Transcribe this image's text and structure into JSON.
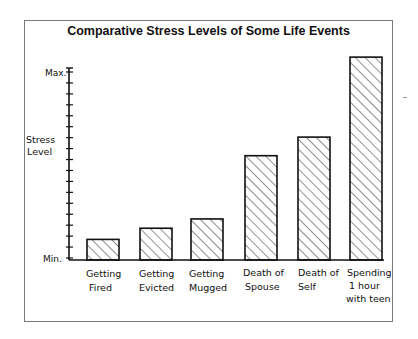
{
  "chart_data": {
    "type": "bar",
    "title": "Comparative Stress Levels of Some Life Events",
    "xlabel": "",
    "ylabel": "Stress Level",
    "y_tick_labels": [
      "Min.",
      "Max."
    ],
    "ylim": [
      0,
      100
    ],
    "grid": false,
    "legend": null,
    "fill_pattern": "diagonal hatch",
    "categories": [
      "Getting Fired",
      "Getting Evicted",
      "Getting Mugged",
      "Death of Spouse",
      "Death of Self",
      "Spending 1 hour with teen"
    ],
    "category_label_lines": [
      [
        "Getting",
        "Fired"
      ],
      [
        "Getting",
        "Evicted"
      ],
      [
        "Getting",
        "Mugged"
      ],
      [
        "Death of",
        "Spouse"
      ],
      [
        "Death of",
        "Self"
      ],
      [
        "Spending",
        "1 hour",
        "with teen"
      ]
    ],
    "values": [
      10,
      16,
      21,
      55,
      65,
      108
    ],
    "annotations": [
      "Last bar exceeds the Max. level of the axis"
    ]
  },
  "labels": {
    "title": "Comparative Stress Levels of Some Life Events",
    "ylabel_line1": "Stress",
    "ylabel_line2": "Level",
    "ymax": "Max.",
    "ymin": "Min.",
    "cat0_l1": "Getting",
    "cat0_l2": "Fired",
    "cat1_l1": "Getting",
    "cat1_l2": "Evicted",
    "cat2_l1": "Getting",
    "cat2_l2": "Mugged",
    "cat3_l1": "Death of",
    "cat3_l2": "Spouse",
    "cat4_l1": "Death of",
    "cat4_l2": "Self",
    "cat5_l1": "Spending",
    "cat5_l2": "1 hour",
    "cat5_l3": "with teen"
  },
  "colors": {
    "ink": "#111111",
    "frame": "#7a7a7a",
    "background": "#ffffff"
  }
}
